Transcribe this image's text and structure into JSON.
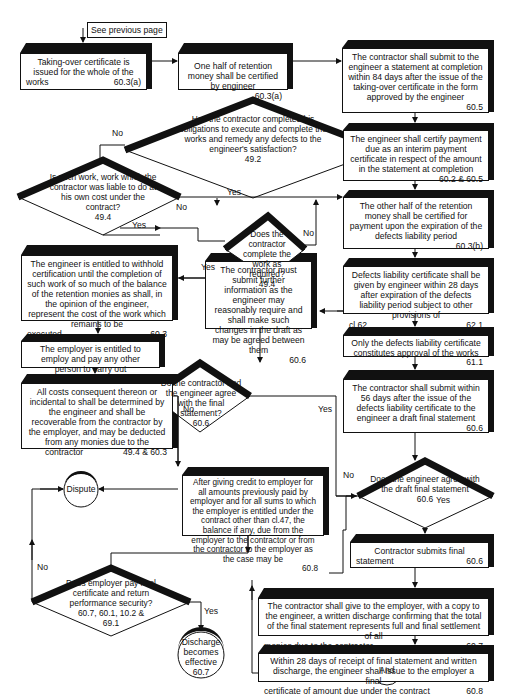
{
  "header": {
    "text": ""
  },
  "note": {
    "label": "See previous page"
  },
  "boxes": {
    "taking_over": {
      "text": "Taking-over certificate is issued for the whole of the",
      "last": "works",
      "ref": "60.3(a)"
    },
    "half_retention": {
      "text": "One half of retention money shall be certified by engineer",
      "ref": "60.3(a)"
    },
    "statement_completion": {
      "text": "The contractor shall submit to the engineer a statement at completion within 84 days after the issue of the taking-over certificate in the form approved by the engineer",
      "ref": "60.5"
    },
    "interim_payment": {
      "text": "The engineer shall certify payment due as an interim payment certificate in respect of the amount in the statement at completion",
      "ref": "60.2 & 60.5"
    },
    "other_half": {
      "text": "The other half of the retention money shall be certified for payment upon the expiration of the defects liability period",
      "ref": "60.3(b)"
    },
    "withhold": {
      "text": "The engineer is entitled to withhold certification until the completion of such work of so much of the balance of the retention monies as shall, in the opinion of the engineer, represent the cost of the work which remains to be",
      "last": "executed",
      "ref": "60.3"
    },
    "defects_cert": {
      "text": "Defects liability certificate shall be given by engineer within 28 days after expiration of the defects liability period subject to other provisions of",
      "last": "cl.62",
      "ref": "62.1"
    },
    "further_info": {
      "text": "The contractor must submit further information as the engineer may reasonably require and shall make such changes in the draft as may be agreed between them",
      "ref": "60.6"
    },
    "employ_other": {
      "text": "The employer is entitled to employ and pay any other person to carry out",
      "last": "work",
      "ref": "49.4"
    },
    "only_defects": {
      "text": "Only the defects liability certificate constitutes approval of the works",
      "ref": "61.1"
    },
    "all_costs": {
      "text": "All costs consequent thereon or incidental to shall be determined by the engineer and shall be recoverable from the contractor by the employer, and may be deducted from any monies due to the",
      "last": "contractor",
      "ref": "49.4 & 60.3"
    },
    "draft_final": {
      "text": "The contractor shall submit within 56 days after the issue of the defects liability certificate to the engineer a draft final statement",
      "ref": "60.6"
    },
    "after_credit": {
      "text": "After giving credit to employer for all amounts previously paid by employer and for all sums to which the employer is entitled under the contract other than cl.47, the balance if any, due from the employer to the contractor or from the contractor to the employer as the case may be",
      "ref": "60.8"
    },
    "submits_final": {
      "text": "Contractor submits final",
      "last": "statement",
      "ref": "60.6"
    },
    "discharge": {
      "text": "The contractor shall give to the employer, with a copy to the engineer, a written discharge confirming that the total of the final statement represents full and final settlement of all",
      "last": "monies due to the contractor",
      "ref": "60.7"
    },
    "final_cert": {
      "text": "Within 28 days of receipt of final statement and written discharge, the engineer shall issue to the employer a final",
      "last": "certificate of amount due under the contract",
      "ref": "60.8"
    }
  },
  "decisions": {
    "completed_obligations": {
      "text": "Has the contractor completed his obligations to execute and complete the works and remedy any defects to the engineer's satisfaction?",
      "ref": "49.2",
      "yes": "Yes",
      "no": "No"
    },
    "liable_work": {
      "text": "Is such work, work which the contractor was liable to do at his own cost under the contract?",
      "ref": "49.4",
      "yes": "Yes",
      "no": "No"
    },
    "complete_required": {
      "text": "Does the contractor complete the work as required?",
      "ref": "49.4",
      "yes": "Yes",
      "no": "No"
    },
    "agree_final": {
      "text": "Do the contractor and the engineer agree with the final statement?",
      "ref": "60.6",
      "yes": "Yes",
      "no": "No"
    },
    "agree_draft": {
      "text": "Does the engineer agree with the draft final statement",
      "ref": "60.6",
      "yes": "Yes",
      "no": "No"
    },
    "employer_pay": {
      "text": "Does employer pay final certificate and return performance security?",
      "ref": "60.7, 60.1, 10.2 & 69.1",
      "yes": "Yes",
      "no": "No"
    }
  },
  "terminals": {
    "dispute": {
      "text": "Dispute"
    },
    "discharge_effective": {
      "text": "Discharge becomes effective",
      "ref": "60.7"
    },
    "and": {
      "text": "And"
    }
  }
}
